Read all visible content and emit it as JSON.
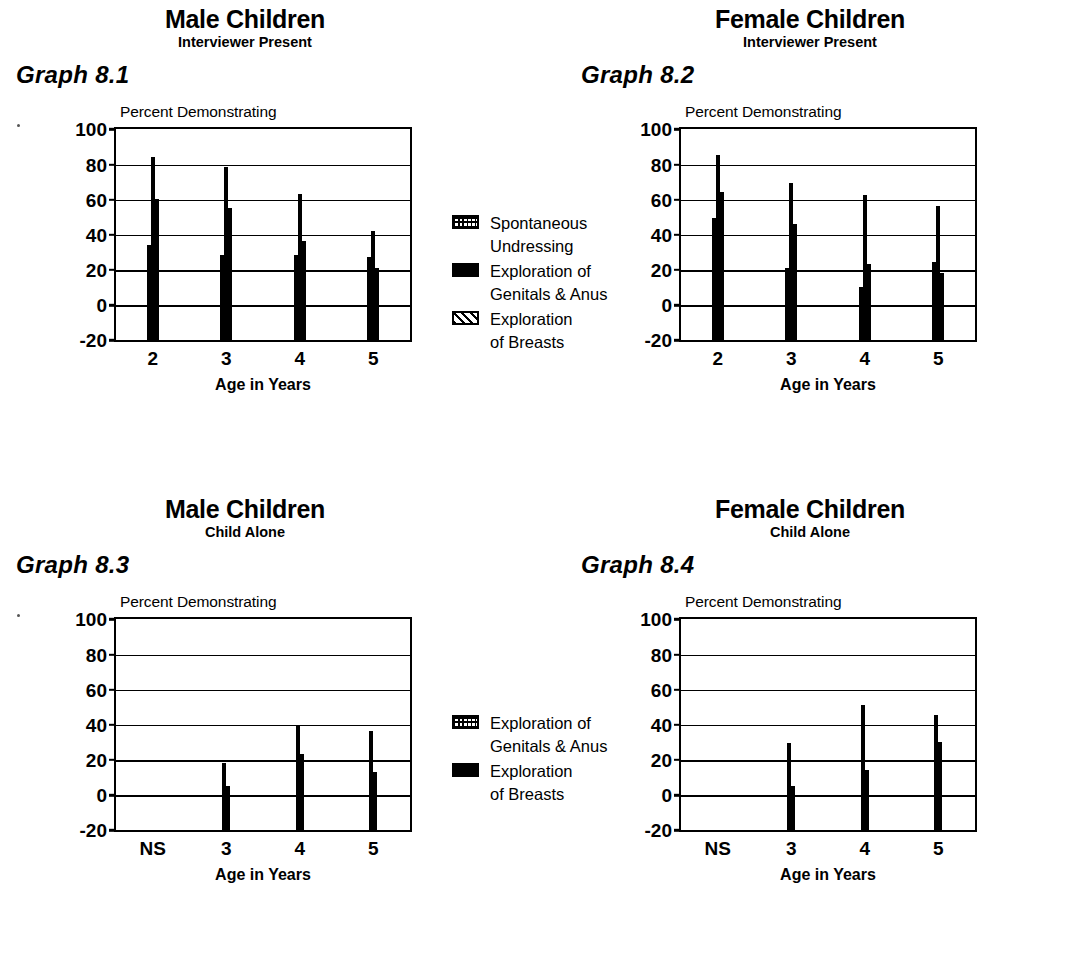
{
  "page": {
    "background": "#ffffff",
    "ink": "#000000"
  },
  "panels": [
    {
      "key": "graph_8_1",
      "title_main": "Male Children",
      "title_sub": "Interviewer Present",
      "graph_label": "Graph 8.1",
      "y_axis_title": "Percent Demonstrating",
      "x_axis_title": "Age in Years"
    },
    {
      "key": "graph_8_2",
      "title_main": "Female Children",
      "title_sub": "Interviewer Present",
      "graph_label": "Graph 8.2",
      "y_axis_title": "Percent Demonstrating",
      "x_axis_title": "Age in Years"
    },
    {
      "key": "graph_8_3",
      "title_main": "Male Children",
      "title_sub": "Child Alone",
      "graph_label": "Graph 8.3",
      "y_axis_title": "Percent Demonstrating",
      "x_axis_title": "Age in Years"
    },
    {
      "key": "graph_8_4",
      "title_main": "Female Children",
      "title_sub": "Child Alone",
      "graph_label": "Graph 8.4",
      "y_axis_title": "Percent Demonstrating",
      "x_axis_title": "Age in Years"
    }
  ],
  "legends": {
    "interviewer_present": {
      "entries": [
        {
          "pattern": "cross",
          "label": "Spontaneous\nUndressing"
        },
        {
          "pattern": "solid",
          "label": "Exploration of\nGenitals & Anus"
        },
        {
          "pattern": "diag",
          "label": "Exploration\nof Breasts"
        }
      ]
    },
    "child_alone": {
      "entries": [
        {
          "pattern": "cross",
          "label": "Exploration of\nGenitals & Anus"
        },
        {
          "pattern": "solid",
          "label": "Exploration\nof Breasts"
        }
      ]
    }
  },
  "chart_data": [
    {
      "id": "graph_8_1",
      "type": "bar",
      "title": "Male Children",
      "subtitle": "Interviewer Present",
      "label": "Graph 8.1",
      "xlabel": "Age in Years",
      "ylabel": "Percent Demonstrating",
      "ylim": [
        -20,
        100
      ],
      "yticks": [
        100,
        80,
        60,
        40,
        20,
        0,
        -20
      ],
      "grid": true,
      "legend_position": "right",
      "categories": [
        "2",
        "3",
        "4",
        "5"
      ],
      "series": [
        {
          "name": "Spontaneous Undressing",
          "pattern": "cross",
          "values": [
            35,
            29,
            29,
            28
          ]
        },
        {
          "name": "Exploration of Genitals & Anus",
          "pattern": "solid",
          "values": [
            85,
            79,
            64,
            43
          ]
        },
        {
          "name": "Exploration of Breasts",
          "pattern": "diag",
          "values": [
            61,
            56,
            37,
            22
          ]
        }
      ]
    },
    {
      "id": "graph_8_2",
      "type": "bar",
      "title": "Female Children",
      "subtitle": "Interviewer Present",
      "label": "Graph 8.2",
      "xlabel": "Age in Years",
      "ylabel": "Percent Demonstrating",
      "ylim": [
        -20,
        100
      ],
      "yticks": [
        100,
        80,
        60,
        40,
        20,
        0,
        -20
      ],
      "grid": true,
      "legend_position": "left",
      "categories": [
        "2",
        "3",
        "4",
        "5"
      ],
      "series": [
        {
          "name": "Spontaneous Undressing",
          "pattern": "cross",
          "values": [
            50,
            22,
            11,
            25
          ]
        },
        {
          "name": "Exploration of Genitals & Anus",
          "pattern": "solid",
          "values": [
            86,
            70,
            63,
            57
          ]
        },
        {
          "name": "Exploration of Breasts",
          "pattern": "diag",
          "values": [
            65,
            47,
            24,
            19
          ]
        }
      ]
    },
    {
      "id": "graph_8_3",
      "type": "bar",
      "title": "Male Children",
      "subtitle": "Child Alone",
      "label": "Graph 8.3",
      "xlabel": "Age in Years",
      "ylabel": "Percent Demonstrating",
      "ylim": [
        -20,
        100
      ],
      "yticks": [
        100,
        80,
        60,
        40,
        20,
        0,
        -20
      ],
      "grid": true,
      "legend_position": "right",
      "categories": [
        "NS",
        "3",
        "4",
        "5"
      ],
      "series": [
        {
          "name": "Exploration of Genitals & Anus",
          "pattern": "cross",
          "values": [
            0,
            19,
            40,
            37
          ]
        },
        {
          "name": "Exploration of Breasts",
          "pattern": "solid",
          "values": [
            0,
            6,
            24,
            14
          ]
        }
      ]
    },
    {
      "id": "graph_8_4",
      "type": "bar",
      "title": "Female Children",
      "subtitle": "Child Alone",
      "label": "Graph 8.4",
      "xlabel": "Age in Years",
      "ylabel": "Percent Demonstrating",
      "ylim": [
        -20,
        100
      ],
      "yticks": [
        100,
        80,
        60,
        40,
        20,
        0,
        -20
      ],
      "grid": true,
      "legend_position": "left",
      "categories": [
        "NS",
        "3",
        "4",
        "5"
      ],
      "series": [
        {
          "name": "Exploration of Genitals & Anus",
          "pattern": "cross",
          "values": [
            0,
            30,
            52,
            46
          ]
        },
        {
          "name": "Exploration of Breasts",
          "pattern": "solid",
          "values": [
            0,
            6,
            15,
            31
          ]
        }
      ]
    }
  ]
}
